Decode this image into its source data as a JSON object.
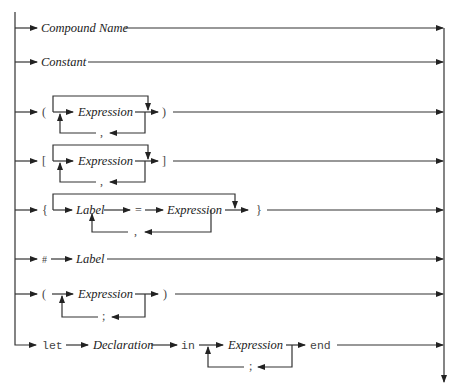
{
  "diagram": {
    "type": "syntax-railroad-diagram",
    "alternatives": [
      {
        "id": "compound-name",
        "items": [
          {
            "kind": "nonterminal",
            "text": "Compound Name"
          }
        ]
      },
      {
        "id": "constant",
        "items": [
          {
            "kind": "nonterminal",
            "text": "Constant"
          }
        ]
      },
      {
        "id": "tuple",
        "open": "(",
        "close": ")",
        "repeat": {
          "item": "Expression",
          "separator": ","
        },
        "optional": true
      },
      {
        "id": "list",
        "open": "[",
        "close": "]",
        "repeat": {
          "item": "Expression",
          "separator": ","
        },
        "optional": true
      },
      {
        "id": "record",
        "open": "{",
        "close": "}",
        "repeat": {
          "items": [
            "Label",
            "=",
            "Expression"
          ],
          "separator": ","
        },
        "optional": true
      },
      {
        "id": "selector",
        "items": [
          {
            "kind": "terminal",
            "text": "#"
          },
          {
            "kind": "nonterminal",
            "text": "Label"
          }
        ]
      },
      {
        "id": "sequence",
        "open": "(",
        "close": ")",
        "repeat": {
          "item": "Expression",
          "separator": ";"
        }
      },
      {
        "id": "let",
        "items": [
          {
            "kind": "keyword",
            "text": "let"
          },
          {
            "kind": "nonterminal",
            "text": "Declaration"
          },
          {
            "kind": "keyword",
            "text": "in"
          }
        ],
        "repeat": {
          "item": "Expression",
          "separator": ";"
        },
        "close": "end"
      }
    ]
  },
  "labels": {
    "compound_name": "Compound Name",
    "constant": "Constant",
    "expression": "Expression",
    "label": "Label",
    "declaration": "Declaration",
    "lparen": "(",
    "rparen": ")",
    "lbracket": "[",
    "rbracket": "]",
    "lbrace": "{",
    "rbrace": "}",
    "comma": ",",
    "semicolon": ";",
    "equals": "=",
    "hash": "#",
    "kw_let": "let",
    "kw_in": "in",
    "kw_end": "end"
  }
}
